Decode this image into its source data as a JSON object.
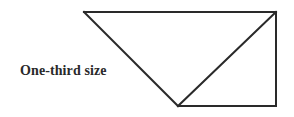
{
  "caption": "One-third size",
  "diagram": {
    "stroke_color": "#2a2a2a",
    "stroke_width": 2,
    "vertices": {
      "top_left": [
        84,
        12
      ],
      "top_right": [
        276,
        12
      ],
      "bottom": [
        178,
        106
      ],
      "bottom_right": [
        276,
        106
      ]
    },
    "segments": [
      [
        "top_left",
        "top_right"
      ],
      [
        "top_left",
        "bottom"
      ],
      [
        "bottom",
        "top_right"
      ],
      [
        "top_right",
        "bottom_right"
      ],
      [
        "bottom",
        "bottom_right"
      ]
    ]
  }
}
